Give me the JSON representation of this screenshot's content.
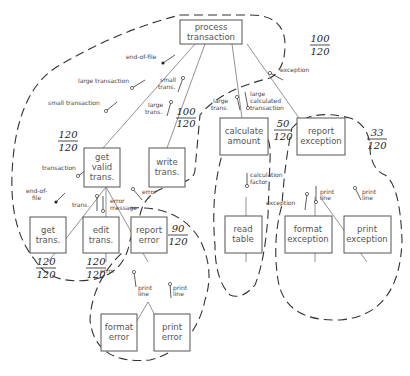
{
  "modules": {
    "process_transaction": [
      "process",
      "transaction"
    ],
    "get_valid_trans": [
      "get",
      "valid",
      "trans."
    ],
    "write_trans": [
      "write",
      "trans."
    ],
    "calculate_amount": [
      "calculate",
      "amount"
    ],
    "report_exception": [
      "report",
      "exception"
    ],
    "get_trans": [
      "get",
      "trans."
    ],
    "edit_trans": [
      "edit",
      "trans."
    ],
    "report_error": [
      "report",
      "error"
    ],
    "read_table": [
      "read",
      "table"
    ],
    "format_exception": [
      "format",
      "exception"
    ],
    "print_exception": [
      "print",
      "exception"
    ],
    "format_error": [
      "format",
      "error"
    ],
    "print_error": [
      "print",
      "error"
    ]
  },
  "couples": {
    "end_of_file_top": "end-of-file",
    "large_transaction": "large transaction",
    "small_transaction": "small transaction",
    "small_trans": [
      "small",
      "trans."
    ],
    "large_trans_write": [
      "large",
      "trans."
    ],
    "large_trans_calc": [
      "large",
      "trans."
    ],
    "large_calculated_transaction": [
      "large",
      "calculated",
      "transaction"
    ],
    "exception_top": "exception",
    "transaction": "transaction",
    "end_of_file_left": [
      "end-of-",
      "file"
    ],
    "trans": "trans.",
    "error_message": [
      "error",
      "message"
    ],
    "error_right": "error",
    "error_bottom": "error",
    "calculation_factor": [
      "calculation",
      "factor"
    ],
    "exception_left": "exception",
    "print_line_fe": [
      "print",
      "line"
    ],
    "print_line_pe": [
      "print",
      "line"
    ],
    "print_line_ferr": [
      "print",
      "line"
    ],
    "print_line_perr": [
      "print",
      "line"
    ]
  },
  "fractions": {
    "process_transaction": {
      "num": "100",
      "den": "120"
    },
    "get_valid_trans": {
      "num": "120",
      "den": "120"
    },
    "write_trans": {
      "num": "100",
      "den": "120"
    },
    "calculate_amount": {
      "num": "50",
      "den": "120"
    },
    "report_exception": {
      "num": "33",
      "den": "120"
    },
    "report_error": {
      "num": "90",
      "den": "120"
    },
    "get_trans": {
      "num": "120",
      "den": "120"
    },
    "edit_trans": {
      "num": "120",
      "den": "120"
    }
  }
}
